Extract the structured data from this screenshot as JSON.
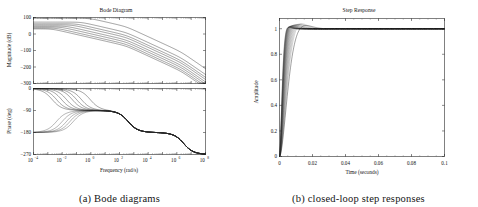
{
  "figure": {
    "panels": [
      {
        "id": "bode",
        "caption": "(a) Bode diagrams",
        "title": "Bode Diagram"
      },
      {
        "id": "step",
        "caption": "(b) closed-loop step responses",
        "title": "Step Response"
      }
    ]
  },
  "chart_data": [
    {
      "type": "line",
      "id": "bode-magnitude",
      "title": "Bode Diagram",
      "xlabel": "Frequency  (rad/s)",
      "ylabel": "Magnitude (dB)",
      "xscale": "log",
      "xlim": [
        0.0001,
        100000000
      ],
      "ylim": [
        -300,
        100
      ],
      "grid": false,
      "legend": null,
      "xticks": [
        "10-4",
        "10-2",
        "100",
        "102",
        "104",
        "106",
        "108"
      ],
      "xtick_values": [
        0.0001,
        0.01,
        1,
        100,
        10000,
        1000000,
        100000000
      ],
      "yticks": [
        "100",
        "0",
        "-100",
        "-200",
        "-300"
      ],
      "ytick_values": [
        100,
        0,
        -100,
        -200,
        -300
      ],
      "series": [
        {
          "name": "K1",
          "dc_gain_db": 95,
          "corner_rad_s": 0.9,
          "slope_db_per_dec": -40
        },
        {
          "name": "K2",
          "dc_gain_db": 72,
          "corner_rad_s": 0.22,
          "slope_db_per_dec": -40
        },
        {
          "name": "K3",
          "dc_gain_db": 62,
          "corner_rad_s": 0.1,
          "slope_db_per_dec": -40
        },
        {
          "name": "K4",
          "dc_gain_db": 55,
          "corner_rad_s": 0.05,
          "slope_db_per_dec": -40
        },
        {
          "name": "K5",
          "dc_gain_db": 48,
          "corner_rad_s": 0.02,
          "slope_db_per_dec": -40
        },
        {
          "name": "K6",
          "dc_gain_db": 42,
          "corner_rad_s": 0.009,
          "slope_db_per_dec": -40
        },
        {
          "name": "K7",
          "dc_gain_db": 36,
          "corner_rad_s": 0.004,
          "slope_db_per_dec": -40
        },
        {
          "name": "K8",
          "dc_gain_db": 31,
          "corner_rad_s": 0.002,
          "slope_db_per_dec": -40
        }
      ],
      "description": "Family of open-loop magnitude responses; all converge above 1 rad/s and roll off to about -260 dB at 1e8 rad/s."
    },
    {
      "type": "line",
      "id": "bode-phase",
      "title": "",
      "xlabel": "Frequency  (rad/s)",
      "ylabel": "Phase (deg)",
      "xscale": "log",
      "xlim": [
        0.0001,
        100000000
      ],
      "ylim": [
        -270,
        0
      ],
      "grid": false,
      "xticks": [
        "10-4",
        "10-2",
        "100",
        "102",
        "104",
        "106",
        "108"
      ],
      "xtick_values": [
        0.0001,
        0.01,
        1,
        100,
        10000,
        1000000,
        100000000
      ],
      "yticks": [
        "0",
        "-90",
        "-180",
        "-270"
      ],
      "ytick_values": [
        0,
        -90,
        -180,
        -270
      ],
      "series": [
        {
          "name": "P-upper",
          "start_deg": 0,
          "mid_deg": -90,
          "end_deg": -270
        },
        {
          "name": "P-lower",
          "start_deg": -180,
          "mid_deg": -90,
          "end_deg": -270
        }
      ],
      "description": "Upper bundle drops from 0 deg toward -90 deg; lower bundle rises from -180 deg to -90 deg; all merge near 2 rad/s, plateau near -100 deg, then fall through -180 deg and end at -270 deg."
    },
    {
      "type": "line",
      "id": "step-response",
      "title": "Step Response",
      "xlabel": "Time (seconds)",
      "ylabel": "Amplitude",
      "xscale": "linear",
      "xlim": [
        0,
        0.1
      ],
      "ylim": [
        0,
        1.08
      ],
      "grid": false,
      "xticks": [
        "0",
        "0.02",
        "0.04",
        "0.06",
        "0.08",
        "0.1"
      ],
      "xtick_values": [
        0,
        0.02,
        0.04,
        0.06,
        0.08,
        0.1
      ],
      "yticks": [
        "0",
        "0.2",
        "0.4",
        "0.6",
        "0.8",
        "1"
      ],
      "ytick_values": [
        0,
        0.2,
        0.4,
        0.6,
        0.8,
        1
      ],
      "series": [
        {
          "name": "closed-loop-1",
          "rise_time_s": 0.012,
          "overshoot": 1.02,
          "settling_time_s": 0.022,
          "final_value": 1.0
        },
        {
          "name": "closed-loop-family",
          "rise_time_s": 0.011,
          "overshoot": 1.03,
          "settling_time_s": 0.02,
          "final_value": 1.0
        }
      ],
      "points": [
        {
          "t": 0.0,
          "y": 0.0
        },
        {
          "t": 0.002,
          "y": 0.1
        },
        {
          "t": 0.004,
          "y": 0.3
        },
        {
          "t": 0.006,
          "y": 0.5
        },
        {
          "t": 0.008,
          "y": 0.68
        },
        {
          "t": 0.01,
          "y": 0.82
        },
        {
          "t": 0.012,
          "y": 0.92
        },
        {
          "t": 0.014,
          "y": 0.98
        },
        {
          "t": 0.016,
          "y": 1.01
        },
        {
          "t": 0.018,
          "y": 1.02
        },
        {
          "t": 0.02,
          "y": 1.02
        },
        {
          "t": 0.024,
          "y": 1.01
        },
        {
          "t": 0.03,
          "y": 1.0
        },
        {
          "t": 0.05,
          "y": 1.0
        },
        {
          "t": 0.1,
          "y": 1.0
        }
      ],
      "description": "Overlaid closed-loop step responses; fast rise to unity by ~0.02 s with slight overshoot, flat at 1 thereafter."
    }
  ]
}
